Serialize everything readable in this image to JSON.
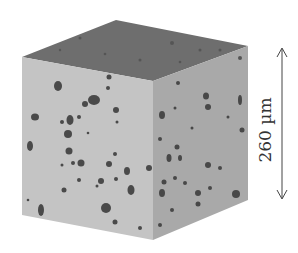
{
  "figure": {
    "scale_bar": {
      "label": "260 µm",
      "direction": "vertical"
    },
    "colors": {
      "top_face": "#6e6e6e",
      "front_face": "#c4c4c4",
      "right_face": "#a8a8a8",
      "pores": "#4a4a4a",
      "scale": "#444444"
    }
  }
}
